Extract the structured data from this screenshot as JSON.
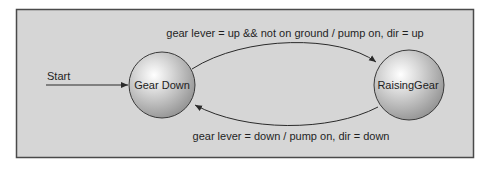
{
  "diagram": {
    "type": "state-machine",
    "colors": {
      "background": "#d6d6d6",
      "frame_border": "#4a4a4a",
      "state_fill_light": "#ffffff",
      "state_fill_dark": "#8e8e8e",
      "state_border": "#3a3a3a",
      "edge": "#2a2a2a",
      "text": "#1f1f1f"
    },
    "start": {
      "label": "Start"
    },
    "states": [
      {
        "id": "gear-down",
        "label": "Gear Down"
      },
      {
        "id": "raising-gear",
        "label": "RaisingGear"
      }
    ],
    "transitions": [
      {
        "from": "start",
        "to": "gear-down",
        "label": ""
      },
      {
        "from": "gear-down",
        "to": "raising-gear",
        "label": "gear lever = up && not on ground / pump on, dir = up"
      },
      {
        "from": "raising-gear",
        "to": "gear-down",
        "label": "gear lever = down / pump on, dir = down"
      }
    ]
  }
}
